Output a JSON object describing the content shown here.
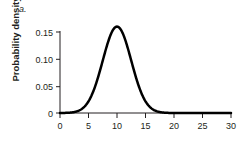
{
  "panel": {
    "label": "a."
  },
  "axes": {
    "ylabel": "Probability density",
    "xlabel": "",
    "y_ticks": [
      "0",
      "0.05",
      "0.10",
      "0.15"
    ],
    "x_ticks": [
      "0",
      "5",
      "10",
      "15",
      "20",
      "25",
      "30"
    ]
  },
  "style": {
    "curve_color": "#000000",
    "axis_color": "#231f20",
    "background": "#ffffff",
    "curve_width": 2.5
  },
  "chart_data": {
    "type": "line",
    "title": "",
    "xlabel": "",
    "ylabel": "Probability density",
    "xlim": [
      0,
      30
    ],
    "ylim": [
      0,
      0.17
    ],
    "xticks": [
      0,
      5,
      10,
      15,
      20,
      25,
      30
    ],
    "yticks": [
      0,
      0.05,
      0.1,
      0.15
    ],
    "grid": false,
    "legend": null,
    "distribution": {
      "kind": "normal",
      "mean": 10,
      "sd": 2.5,
      "peak_density": 0.16
    },
    "series": [
      {
        "name": "Probability density",
        "x": [
          0,
          1,
          2,
          2.5,
          3,
          3.5,
          4,
          4.5,
          5,
          5.5,
          6,
          6.5,
          7,
          7.5,
          8,
          8.5,
          9,
          9.5,
          10,
          10.5,
          11,
          11.5,
          12,
          12.5,
          13,
          13.5,
          14,
          14.5,
          15,
          15.5,
          16,
          16.5,
          17,
          17.5,
          18,
          20,
          25,
          30
        ],
        "values": [
          0.0,
          0.0001,
          0.0005,
          0.0011,
          0.0022,
          0.004,
          0.007,
          0.0116,
          0.018,
          0.0264,
          0.0368,
          0.0486,
          0.0609,
          0.0724,
          0.0818,
          0.0879,
          0.09,
          0.0879,
          0.08,
          0.0879,
          0.0818,
          0.0724,
          0.0609,
          0.0486,
          0.0368,
          0.0264,
          0.018,
          0.0116,
          0.007,
          0.004,
          0.0022,
          0.0011,
          0.0005,
          0.0002,
          0.0001,
          0.0,
          0.0,
          0.0
        ]
      }
    ]
  }
}
